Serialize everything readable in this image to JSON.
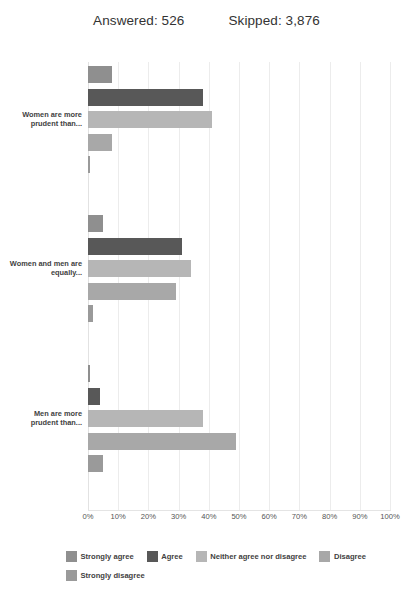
{
  "header": {
    "answered_label": "Answered: 526",
    "skipped_label": "Skipped: 3,876"
  },
  "chart_data": {
    "type": "bar",
    "orientation": "horizontal",
    "title": "",
    "xlabel": "",
    "ylabel": "",
    "xlim": [
      0,
      100
    ],
    "x_tick_labels": [
      "0%",
      "10%",
      "20%",
      "30%",
      "40%",
      "50%",
      "60%",
      "70%",
      "80%",
      "90%",
      "100%"
    ],
    "x_ticks": [
      0,
      10,
      20,
      30,
      40,
      50,
      60,
      70,
      80,
      90,
      100
    ],
    "grid": true,
    "legend_position": "bottom",
    "categories": [
      "Women are more prudent than...",
      "Women and men are equally...",
      "Men are more prudent than..."
    ],
    "series": [
      {
        "name": "Strongly agree",
        "color": "#8f8f8f",
        "values": [
          8,
          5,
          0.4
        ]
      },
      {
        "name": "Agree",
        "color": "#585858",
        "values": [
          38,
          31,
          4
        ]
      },
      {
        "name": "Neither agree nor disagree",
        "color": "#b6b6b6",
        "values": [
          41,
          34,
          38
        ]
      },
      {
        "name": "Disagree",
        "color": "#a8a8a8",
        "values": [
          8,
          29,
          49
        ]
      },
      {
        "name": "Strongly disagree",
        "color": "#9a9a9a",
        "values": [
          0.5,
          1.5,
          5
        ]
      }
    ]
  },
  "legend": {
    "items": [
      {
        "label": "Strongly agree",
        "color": "#8f8f8f"
      },
      {
        "label": "Agree",
        "color": "#585858"
      },
      {
        "label": "Neither agree nor disagree",
        "color": "#b6b6b6"
      },
      {
        "label": "Disagree",
        "color": "#a8a8a8"
      },
      {
        "label": "Strongly disagree",
        "color": "#9a9a9a"
      }
    ]
  }
}
